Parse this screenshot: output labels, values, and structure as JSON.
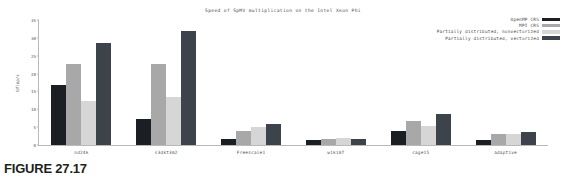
{
  "caption": "FIGURE 27.17",
  "legend": {
    "position": "top-right",
    "entries": [
      {
        "label": "OpenMP CRS",
        "color": "#1b1f24"
      },
      {
        "label": "MPI CRS",
        "color": "#a8a8a8"
      },
      {
        "label": "Partially distributed, nonvectorized",
        "color": "#d6d6d6"
      },
      {
        "label": "Partially distributed, vectorized",
        "color": "#3d434a"
      }
    ]
  },
  "chart_data": {
    "type": "bar",
    "title": "Speed of SpMV multiplication on the Intel Xeon Phi",
    "xlabel": "",
    "ylabel": "Gflop/s",
    "ylim": [
      0,
      35
    ],
    "yticks": [
      0,
      5,
      10,
      15,
      20,
      25,
      30,
      35
    ],
    "grid": false,
    "categories": [
      "nd24k",
      "s3dkt3m2",
      "Freescale1",
      "wiki07",
      "cage15",
      "adaptive"
    ],
    "series": [
      {
        "name": "OpenMP CRS",
        "color": "#1b1f24",
        "values": [
          16.7,
          7.3,
          1.8,
          1.5,
          3.9,
          1.5
        ]
      },
      {
        "name": "MPI CRS",
        "color": "#a8a8a8",
        "values": [
          22.7,
          22.7,
          4.0,
          1.7,
          6.6,
          3.2
        ]
      },
      {
        "name": "Partially distributed, nonvectorized",
        "color": "#d6d6d6",
        "values": [
          12.3,
          13.4,
          5.0,
          2.0,
          5.2,
          3.2
        ]
      },
      {
        "name": "Partially distributed, vectorized",
        "color": "#3d434a",
        "values": [
          28.5,
          32.0,
          5.9,
          1.7,
          8.8,
          3.7
        ]
      }
    ]
  }
}
